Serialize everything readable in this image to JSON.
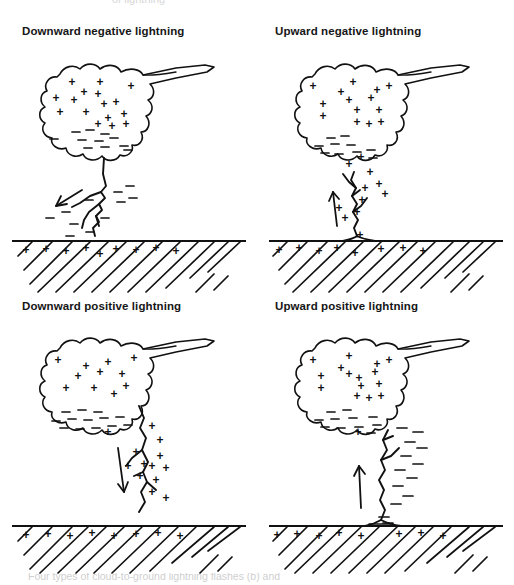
{
  "figure": {
    "background_color": "#ffffff",
    "ink_color": "#111111",
    "top_cut_text": "of lightning",
    "bottom_caption_cut": "Four types of cloud-to-ground lightning flashes (b) and"
  },
  "panels": [
    {
      "id": "downward-negative",
      "title": "Downward negative lightning",
      "direction": "downward",
      "polarity": "negative",
      "arrow": "down-left",
      "cloud_top_charge": "+",
      "cloud_base_charge": "−",
      "channel_charge": "−",
      "ground_charge": "+"
    },
    {
      "id": "upward-negative",
      "title": "Upward negative lightning",
      "direction": "upward",
      "polarity": "negative",
      "arrow": "up",
      "cloud_top_charge": "+",
      "cloud_base_charge": "−",
      "channel_charge": "+",
      "ground_charge": "+"
    },
    {
      "id": "downward-positive",
      "title": "Downward positive lightning",
      "direction": "downward",
      "polarity": "positive",
      "arrow": "down",
      "cloud_top_charge": "+",
      "cloud_base_charge": "−",
      "channel_charge": "+",
      "ground_charge": "+"
    },
    {
      "id": "upward-positive",
      "title": "Upward positive lightning",
      "direction": "upward",
      "polarity": "positive",
      "arrow": "up",
      "cloud_top_charge": "+",
      "cloud_base_charge": "−",
      "channel_charge": "−",
      "ground_charge": "+"
    }
  ],
  "symbols": {
    "plus": "+",
    "minus": "−"
  },
  "charge_layout": {
    "cloud_plus": [
      [
        62,
        42
      ],
      [
        40,
        56
      ],
      [
        58,
        62
      ],
      [
        62,
        27
      ],
      [
        95,
        35
      ],
      [
        82,
        58
      ],
      [
        70,
        76
      ],
      [
        100,
        62
      ],
      [
        112,
        50
      ],
      [
        106,
        74
      ],
      [
        88,
        78
      ],
      [
        118,
        74
      ]
    ],
    "cloud_minus": [
      [
        30,
        93
      ],
      [
        48,
        86
      ],
      [
        62,
        88
      ],
      [
        76,
        95
      ],
      [
        55,
        100
      ],
      [
        88,
        100
      ],
      [
        70,
        106
      ],
      [
        100,
        104
      ],
      [
        113,
        98
      ]
    ]
  }
}
